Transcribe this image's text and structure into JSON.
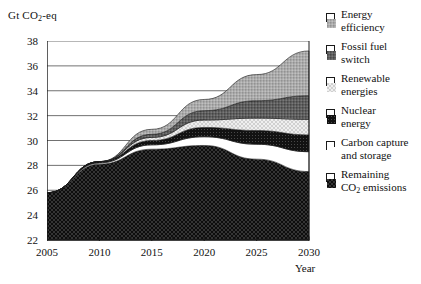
{
  "chart_data": {
    "type": "area",
    "title": "",
    "subtitle": "",
    "ylabel": "Gt CO2-eq",
    "ylabel_parts": {
      "prefix": "Gt CO",
      "sub": "2",
      "suffix": "-eq"
    },
    "xlabel": "Year",
    "xlim": [
      2005,
      2030
    ],
    "ylim": [
      22,
      38
    ],
    "ytick_step": 2,
    "xtick_step": 5,
    "x_minor_tick_step": 1,
    "grid": true,
    "grid_axis": "y",
    "legend_position": "right",
    "stack_order": "bottom-to-top",
    "yticks": [
      22,
      24,
      26,
      28,
      30,
      32,
      34,
      36,
      38
    ],
    "xticks": [
      2005,
      2010,
      2015,
      2020,
      2025,
      2030
    ],
    "x": [
      2005,
      2010,
      2015,
      2020,
      2025,
      2030
    ],
    "baseline": 22,
    "total_top": [
      25.8,
      28.3,
      30.9,
      33.3,
      35.3,
      37.2
    ],
    "series": [
      {
        "name": "Remaining CO2 emissions",
        "name_parts": {
          "prefix": "Remaining\nCO",
          "sub": "2",
          "suffix": " emissions"
        },
        "pattern": "black-dotted",
        "color": "#0d0d0d",
        "values": [
          3.8,
          6.1,
          7.3,
          7.6,
          6.5,
          5.5
        ],
        "cumulative_top": [
          25.8,
          28.1,
          29.3,
          29.6,
          28.5,
          27.5
        ]
      },
      {
        "name": "Carbon capture and storage",
        "pattern": "white",
        "color": "#ffffff",
        "values": [
          0.0,
          0.1,
          0.35,
          0.7,
          1.2,
          1.6
        ],
        "cumulative_top": [
          25.8,
          28.2,
          29.65,
          30.3,
          29.7,
          29.1
        ]
      },
      {
        "name": "Nuclear energy",
        "pattern": "black-fine-dotted",
        "color": "#121212",
        "values": [
          0.0,
          0.1,
          0.35,
          0.75,
          1.1,
          1.35
        ],
        "cumulative_top": [
          25.8,
          28.3,
          30.0,
          31.05,
          30.8,
          30.45
        ]
      },
      {
        "name": "Renewable energies",
        "pattern": "light-dotted",
        "color": "#ececec",
        "values": [
          0.0,
          0.0,
          0.25,
          0.6,
          1.0,
          1.25
        ],
        "cumulative_top": [
          25.8,
          28.3,
          30.25,
          31.65,
          31.8,
          31.7
        ]
      },
      {
        "name": "Fossil fuel switch",
        "pattern": "dark-gray-dotted",
        "color": "#5e5e5e",
        "values": [
          0.0,
          0.0,
          0.25,
          0.75,
          1.4,
          1.9
        ],
        "cumulative_top": [
          25.8,
          28.3,
          30.5,
          32.4,
          33.2,
          33.6
        ]
      },
      {
        "name": "Energy efficiency",
        "pattern": "mid-gray-dotted",
        "color": "#a8a8a8",
        "values": [
          0.0,
          0.0,
          0.4,
          0.9,
          2.1,
          3.6
        ],
        "cumulative_top": [
          25.8,
          28.3,
          30.9,
          33.3,
          35.3,
          37.2
        ]
      }
    ]
  },
  "legend": {
    "items": [
      {
        "label_line1": "Energy",
        "label_line2": "efficiency",
        "swatch": "mid-gray-dotted"
      },
      {
        "label_line1": "Fossil fuel",
        "label_line2": "switch",
        "swatch": "dark-gray-dotted"
      },
      {
        "label_line1": "Renewable",
        "label_line2": "energies",
        "swatch": "light-dotted"
      },
      {
        "label_line1": "Nuclear",
        "label_line2": "energy",
        "swatch": "black-fine-dotted"
      },
      {
        "label_line1": "Carbon capture",
        "label_line2": "and storage",
        "swatch": "white"
      },
      {
        "label_line1": "Remaining",
        "label_line2_prefix": "CO",
        "label_line2_sub": "2",
        "label_line2_suffix": " emissions",
        "swatch": "black-dotted"
      }
    ]
  },
  "colors": {
    "axis": "#1a1a1a",
    "grid": "#4d4d4d",
    "background": "#ffffff",
    "text": "#111111"
  }
}
